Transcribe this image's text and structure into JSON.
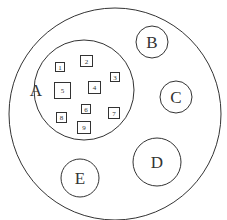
{
  "diagram": {
    "type": "nested-set-diagram",
    "outer": {
      "cx": 115,
      "cy": 114,
      "r": 106
    },
    "circles": [
      {
        "label": "A",
        "cx": 84,
        "cy": 90,
        "r": 50,
        "label_x": 36,
        "label_y": 96
      },
      {
        "label": "B",
        "cx": 152,
        "cy": 42,
        "r": 16,
        "label_x": 152,
        "label_y": 48
      },
      {
        "label": "C",
        "cx": 176,
        "cy": 97,
        "r": 16,
        "label_x": 176,
        "label_y": 103
      },
      {
        "label": "D",
        "cx": 157,
        "cy": 162,
        "r": 24,
        "label_x": 157,
        "label_y": 168
      },
      {
        "label": "E",
        "cx": 80,
        "cy": 178,
        "r": 19,
        "label_x": 80,
        "label_y": 184
      }
    ],
    "squares": [
      {
        "label": "1",
        "x": 55,
        "y": 62,
        "w": 9,
        "h": 9
      },
      {
        "label": "2",
        "x": 80,
        "y": 55,
        "w": 12,
        "h": 11
      },
      {
        "label": "3",
        "x": 110,
        "y": 72,
        "w": 9,
        "h": 9
      },
      {
        "label": "4",
        "x": 88,
        "y": 81,
        "w": 12,
        "h": 12
      },
      {
        "label": "5",
        "x": 54,
        "y": 82,
        "w": 16,
        "h": 16
      },
      {
        "label": "6",
        "x": 81,
        "y": 104,
        "w": 9,
        "h": 9
      },
      {
        "label": "7",
        "x": 108,
        "y": 107,
        "w": 11,
        "h": 11
      },
      {
        "label": "8",
        "x": 56,
        "y": 112,
        "w": 10,
        "h": 10
      },
      {
        "label": "9",
        "x": 77,
        "y": 121,
        "w": 13,
        "h": 12
      }
    ]
  }
}
